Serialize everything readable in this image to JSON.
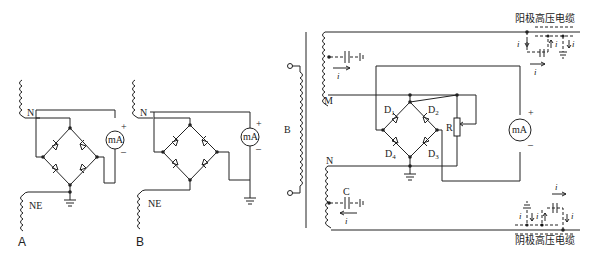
{
  "panels": {
    "A": {
      "caption": "A",
      "coil_top_label": "N",
      "coil_bottom_label": "NE",
      "meter_label": "mA",
      "meter_plus": "+",
      "meter_minus": "–"
    },
    "B": {
      "caption": "B",
      "coil_top_label": "N",
      "coil_bottom_label": "NE",
      "meter_label": "mA",
      "meter_plus": "+",
      "meter_minus": "–"
    },
    "C": {
      "primary_label": "B",
      "secondary_top_label": "M",
      "secondary_bottom_label": "N",
      "capacitor_label": "C",
      "diodes": [
        "D1",
        "D2",
        "D3",
        "D4"
      ],
      "resistor_label": "R",
      "meter_label": "mA",
      "meter_plus": "+",
      "meter_minus": "–",
      "current_symbol": "i",
      "current_subscript": "c",
      "anode_cable_label": "阳极高压电缆",
      "cathode_cable_label": "阴极高压电缆"
    }
  },
  "colors": {
    "line": "#222222",
    "background": "#ffffff"
  }
}
